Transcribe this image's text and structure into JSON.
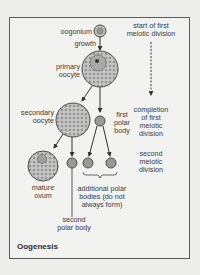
{
  "title": "Oogenesis",
  "cells": {
    "oogonium": "oogonium",
    "growth": "growth",
    "primary_oocyte": [
      "primary",
      "oocyte"
    ],
    "secondary_oocyte": [
      "secondary",
      "oocyte"
    ],
    "first_polar_body": [
      "first",
      "polar",
      "body"
    ],
    "mature_ovum": [
      "mature",
      "ovum"
    ],
    "second_polar_body": [
      "second",
      "polar body"
    ],
    "additional_polar_bodies": [
      "additional polar",
      "bodies (do not",
      "always form)"
    ]
  },
  "stages": {
    "start": [
      "start of first",
      "meiotic division"
    ],
    "completion": [
      "completion",
      "of first",
      "meiotic",
      "division"
    ],
    "second": [
      "second",
      "meiotic",
      "division"
    ]
  },
  "colors": {
    "cell_fill": "#b8b8b8",
    "cell_stroke": "#4a4a4a",
    "frame": "#5a5a5a",
    "text": "#3a3a3a"
  }
}
